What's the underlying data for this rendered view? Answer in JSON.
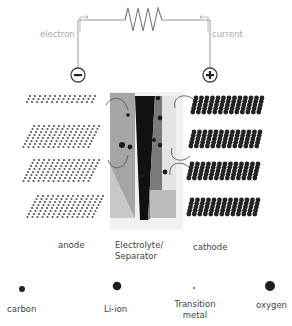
{
  "circuit": {
    "electron_label": "electron",
    "current_label": "current",
    "negative_terminal": "−",
    "positive_terminal": "+",
    "resistor": "resistor-icon"
  },
  "components": {
    "anode_label": "anode",
    "electrolyte_label_line1": "Electrolyte/",
    "electrolyte_label_line2": "Separator",
    "cathode_label": "cathode"
  },
  "legend": {
    "items": [
      {
        "label": "carbon"
      },
      {
        "label": "Li-ion"
      },
      {
        "label_line1": "Transition",
        "label_line2": "metal"
      },
      {
        "label": "oxygen"
      }
    ]
  },
  "colors": {
    "wire": "#999999",
    "atom_dark": "#222222",
    "anode_atom": "#555555",
    "electrolyte_left": "#a8a8a8",
    "electrolyte_right": "#e6e6e6",
    "separator": "#111111"
  }
}
